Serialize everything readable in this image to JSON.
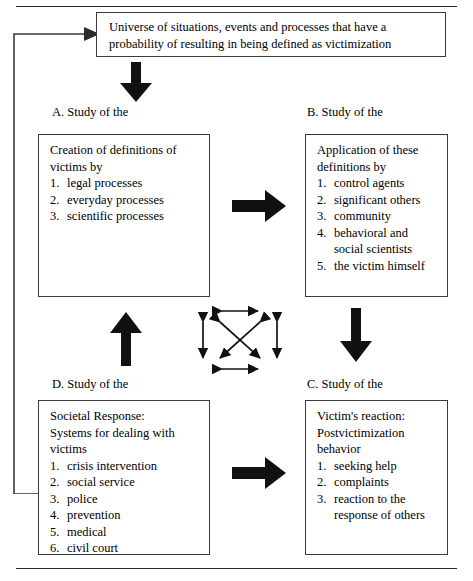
{
  "figure": {
    "universe_box": {
      "text": "Universe of situations, events and processes that have a probability of resulting in being defined as victimization"
    },
    "quadrants": [
      {
        "key": "a",
        "caption": "A. Study of the",
        "heading": "Creation of definitions of\nvictims by",
        "items": [
          {
            "num": "1.",
            "text": "legal processes"
          },
          {
            "num": "2.",
            "text": "everyday processes"
          },
          {
            "num": "3.",
            "text": "scientific processes"
          }
        ]
      },
      {
        "key": "b",
        "caption": "B. Study of the",
        "heading": "Application of these\ndefinitions by",
        "items": [
          {
            "num": "1.",
            "text": "control agents"
          },
          {
            "num": "2.",
            "text": "significant others"
          },
          {
            "num": "3.",
            "text": "community"
          },
          {
            "num": "4.",
            "text": "behavioral and social scientists"
          },
          {
            "num": "5.",
            "text": "the victim himself"
          }
        ]
      },
      {
        "key": "c",
        "caption": "C. Study of the",
        "heading": "Victim's reaction:\nPostvictimization behavior",
        "items": [
          {
            "num": "1.",
            "text": "seeking help"
          },
          {
            "num": "2.",
            "text": "complaints"
          },
          {
            "num": "3.",
            "text": "reaction to the response of others"
          }
        ]
      },
      {
        "key": "d",
        "caption": "D. Study of the",
        "heading": "Societal Response:\nSystems for dealing with\nvictims",
        "items": [
          {
            "num": "1.",
            "text": "crisis intervention"
          },
          {
            "num": "2.",
            "text": "social service"
          },
          {
            "num": "3.",
            "text": "police"
          },
          {
            "num": "4.",
            "text": "prevention"
          },
          {
            "num": "5.",
            "text": "medical"
          },
          {
            "num": "6.",
            "text": "civil court"
          }
        ]
      }
    ],
    "connectors": [
      {
        "key": "universe-to-a",
        "icon": "arrow-down-icon",
        "direction": "down"
      },
      {
        "key": "a-to-b",
        "icon": "arrow-right-icon",
        "direction": "right"
      },
      {
        "key": "b-to-c",
        "icon": "arrow-down-icon",
        "direction": "down"
      },
      {
        "key": "d-to-c",
        "icon": "arrow-right-icon",
        "direction": "right"
      },
      {
        "key": "d-to-a",
        "icon": "arrow-up-icon",
        "direction": "up"
      },
      {
        "key": "feedback-loop",
        "icon": "arrow-right-icon",
        "direction": "loop-left-to-universe"
      }
    ],
    "center_cluster": {
      "description": "Six double-headed arrows interlinking the four quadrants",
      "arrows": [
        {
          "key": "top",
          "direction": "horizontal"
        },
        {
          "key": "bottom",
          "direction": "horizontal"
        },
        {
          "key": "left",
          "direction": "vertical"
        },
        {
          "key": "right",
          "direction": "vertical"
        },
        {
          "key": "diagonal-nw-se",
          "direction": "diagonal"
        },
        {
          "key": "diagonal-ne-sw",
          "direction": "diagonal"
        }
      ]
    },
    "colors": {
      "ink": "#000000",
      "rule": "#2b2b2b",
      "box_border": "#3a3a3a",
      "background": "#ffffff"
    }
  }
}
